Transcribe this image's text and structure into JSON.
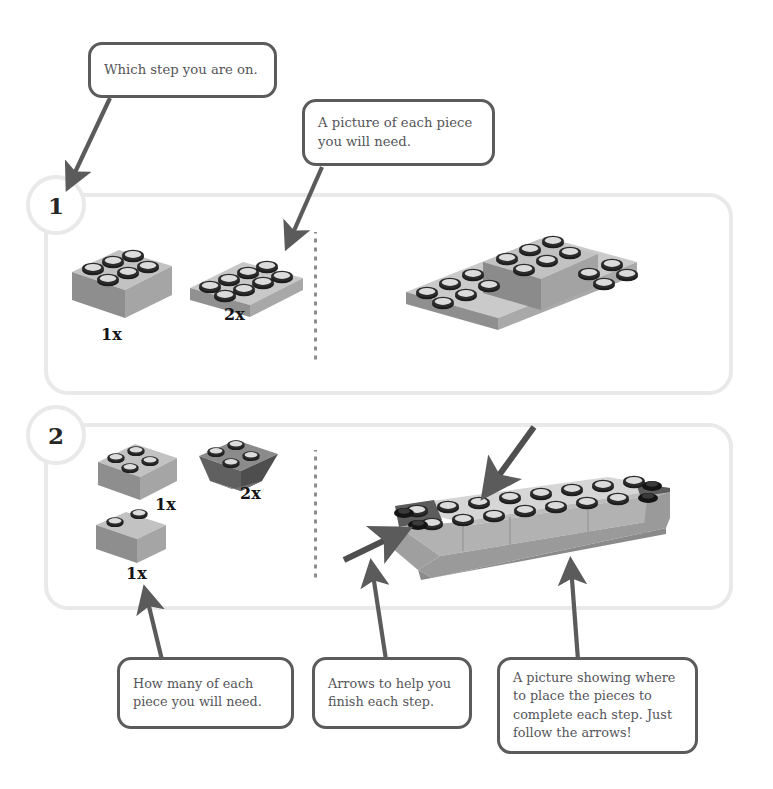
{
  "page": {
    "background": "#ffffff",
    "panel_border_color": "#e9e9e9",
    "callout_border_color": "#5b5b5b",
    "text_color": "#55555a",
    "brick_light": "#b9b9b9",
    "brick_mid": "#9a9a9a",
    "brick_dark": "#6f6f6f",
    "stud_color": "#1d1d1d",
    "arrow_color": "#5b5b5b"
  },
  "callouts": [
    {
      "id": "which-step",
      "text": "Which step you are on."
    },
    {
      "id": "piece-picture",
      "text": "A picture of each piece you will need."
    },
    {
      "id": "how-many",
      "text": "How many of each piece you will need."
    },
    {
      "id": "arrows-help",
      "text": "Arrows to help you finish each step."
    },
    {
      "id": "placement",
      "text": "A picture showing where to place the pieces to complete each step. Just follow the arrows!"
    }
  ],
  "steps": [
    {
      "number": "1",
      "parts": [
        {
          "name": "brick-2x3",
          "qty": "1x"
        },
        {
          "name": "plate-2x4",
          "qty": "2x"
        }
      ]
    },
    {
      "number": "2",
      "parts": [
        {
          "name": "brick-2x2",
          "qty": "1x"
        },
        {
          "name": "slope-inverted-2x2",
          "qty": "2x"
        },
        {
          "name": "brick-1x2",
          "qty": "1x"
        }
      ]
    }
  ],
  "icons": {
    "arrow": "arrow-icon",
    "dotted_divider": "dotted-divider-icon"
  }
}
